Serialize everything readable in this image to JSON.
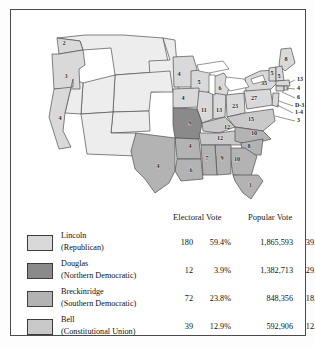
{
  "map": {
    "name": "united-states-1860-electoral-map",
    "colors": {
      "lincoln": "#d9d9d9",
      "douglas": "#8a8a8a",
      "breckinridge": "#b3b3b3",
      "bell": "#c9c9c9",
      "territory": "#ededed",
      "water": "#ffffff",
      "outline": "#4f4f4f"
    },
    "states": [
      {
        "code": "WA",
        "label": "2",
        "party": "lincoln",
        "x": 41,
        "y": 23
      },
      {
        "code": "OR",
        "label": "3",
        "party": "lincoln",
        "x": 43,
        "y": 56
      },
      {
        "code": "CA",
        "label": "4",
        "party": "lincoln",
        "x": 37,
        "y": 98
      },
      {
        "code": "MN",
        "label": "4",
        "party": "lincoln",
        "x": 156,
        "y": 54
      },
      {
        "code": "WI",
        "label": "5",
        "party": "lincoln",
        "x": 176,
        "y": 62
      },
      {
        "code": "MI",
        "label": "6",
        "party": "lincoln",
        "x": 197,
        "y": 68
      },
      {
        "code": "IA",
        "label": "4",
        "party": "lincoln",
        "x": 160,
        "y": 78
      },
      {
        "code": "IL",
        "label": "11",
        "party": "lincoln",
        "x": 181,
        "y": 90
      },
      {
        "code": "IN",
        "label": "13",
        "party": "lincoln",
        "x": 196,
        "y": 90
      },
      {
        "code": "OH",
        "label": "23",
        "party": "lincoln",
        "x": 212,
        "y": 86
      },
      {
        "code": "PA",
        "label": "27",
        "party": "lincoln",
        "x": 231,
        "y": 78
      },
      {
        "code": "NY",
        "label": "35",
        "party": "lincoln",
        "x": 241,
        "y": 63
      },
      {
        "code": "ME",
        "label": "8",
        "party": "lincoln",
        "x": 263,
        "y": 39
      },
      {
        "code": "VT",
        "label": "5",
        "party": "lincoln",
        "x": 249,
        "y": 53
      },
      {
        "code": "NH",
        "label": "5",
        "party": "lincoln",
        "x": 256,
        "y": 56
      },
      {
        "code": "MO",
        "label": "9",
        "party": "douglas",
        "x": 167,
        "y": 103
      },
      {
        "code": "TX",
        "label": "4",
        "party": "breckinridge",
        "x": 135,
        "y": 146
      },
      {
        "code": "AR",
        "label": "4",
        "party": "breckinridge",
        "x": 167,
        "y": 126
      },
      {
        "code": "LA",
        "label": "6",
        "party": "breckinridge",
        "x": 168,
        "y": 150
      },
      {
        "code": "MS",
        "label": "7",
        "party": "breckinridge",
        "x": 184,
        "y": 138
      },
      {
        "code": "AL",
        "label": "9",
        "party": "breckinridge",
        "x": 199,
        "y": 138
      },
      {
        "code": "GA",
        "label": "10",
        "party": "breckinridge",
        "x": 214,
        "y": 139
      },
      {
        "code": "FL",
        "label": "3",
        "party": "breckinridge",
        "x": 227,
        "y": 165
      },
      {
        "code": "SC",
        "label": "8",
        "party": "breckinridge",
        "x": 226,
        "y": 126
      },
      {
        "code": "NC",
        "label": "10",
        "party": "breckinridge",
        "x": 231,
        "y": 113
      },
      {
        "code": "KY",
        "label": "12",
        "party": "bell",
        "x": 204,
        "y": 107
      },
      {
        "code": "TN",
        "label": "12",
        "party": "bell",
        "x": 197,
        "y": 118
      },
      {
        "code": "VA",
        "label": "15",
        "party": "bell",
        "x": 228,
        "y": 99
      }
    ],
    "callouts": [
      {
        "code": "MA",
        "label": "13",
        "x": 274,
        "y": 59
      },
      {
        "code": "RI",
        "label": "4",
        "x": 274,
        "y": 68
      },
      {
        "code": "CT",
        "label": "6",
        "x": 274,
        "y": 77
      },
      {
        "code": "DE",
        "label": "D-3",
        "x": 272,
        "y": 85
      },
      {
        "code": "NJ",
        "label": "1-4",
        "x": 272,
        "y": 92
      },
      {
        "code": "MD",
        "label": "3",
        "x": 274,
        "y": 100
      }
    ]
  },
  "legend": {
    "headers": {
      "electoral": "Electoral Vote",
      "popular": "Popular Vote"
    },
    "rows": [
      {
        "candidate": "Lincoln",
        "party": "(Republican)",
        "color": "#d9d9d9",
        "electoral_votes": "180",
        "electoral_pct": "59.4%",
        "popular_votes": "1,865,593",
        "popular_pct": "39.8%"
      },
      {
        "candidate": "Douglas",
        "party": "(Northern Democratic)",
        "color": "#8a8a8a",
        "electoral_votes": "12",
        "electoral_pct": "3.9%",
        "popular_votes": "1,382,713",
        "popular_pct": "29.5%"
      },
      {
        "candidate": "Breckinridge",
        "party": "(Southern Democratic)",
        "color": "#b3b3b3",
        "electoral_votes": "72",
        "electoral_pct": "23.8%",
        "popular_votes": "848,356",
        "popular_pct": "18.1%"
      },
      {
        "candidate": "Bell",
        "party": "(Constitutional Union)",
        "color": "#c9c9c9",
        "electoral_votes": "39",
        "electoral_pct": "12.9%",
        "popular_votes": "592,906",
        "popular_pct": "12.6%"
      }
    ]
  }
}
